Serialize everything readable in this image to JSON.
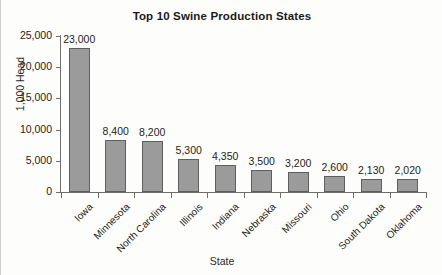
{
  "chart_data": {
    "type": "bar",
    "title": "Top 10 Swine Production States",
    "xlabel": "State",
    "ylabel": "1,000 Head",
    "ylim": [
      0,
      25000
    ],
    "grid": false,
    "legend": "none",
    "categories": [
      "Iowa",
      "Minnesota",
      "North Carolina",
      "Illinois",
      "Indiana",
      "Nebraska",
      "Missouri",
      "Ohio",
      "South Dakota",
      "Oklahoma"
    ],
    "values": [
      23000,
      8400,
      8200,
      5300,
      4350,
      3500,
      3200,
      2600,
      2130,
      2020
    ],
    "value_labels": [
      "23,000",
      "8,400",
      "8,200",
      "5,300",
      "4,350",
      "3,500",
      "3,200",
      "2,600",
      "2,130",
      "2,020"
    ],
    "ytick_values": [
      0,
      5000,
      10000,
      15000,
      20000,
      25000
    ],
    "ytick_labels": [
      "0",
      "5,000",
      "10,000",
      "15,000",
      "20,000",
      "25,000"
    ],
    "bar_color": "#9b9b9b",
    "bar_border_color": "#5f5f5f",
    "axis_color": "#6f6f6f",
    "background_color": "#fdfdfc",
    "text_color": "#1d1d1d"
  }
}
